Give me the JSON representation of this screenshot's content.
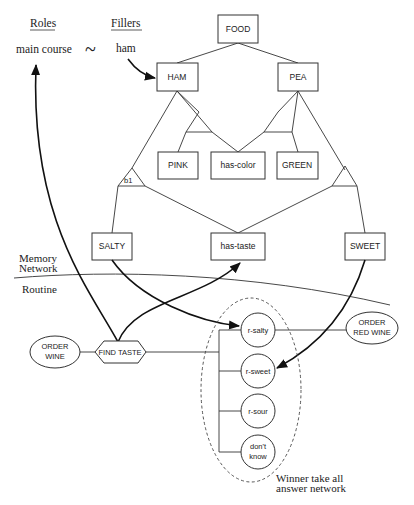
{
  "header": {
    "roles_label": "Roles",
    "fillers_label": "Fillers",
    "role_value": "main course",
    "binding_symbol": "~",
    "filler_value": "ham"
  },
  "memory_network": {
    "region_label_line1": "Memory",
    "region_label_line2": "Network",
    "nodes": {
      "food": "FOOD",
      "ham": "HAM",
      "pea": "PEA",
      "pink": "PINK",
      "has_color": "has-color",
      "green": "GREEN",
      "salty": "SALTY",
      "has_taste": "has-taste",
      "sweet": "SWEET"
    },
    "binding_label": "b1"
  },
  "routine": {
    "region_label": "Routine",
    "order_wine_line1": "ORDER",
    "order_wine_line2": "WINE",
    "find_taste": "FIND TASTE",
    "order_red_wine_line1": "ORDER",
    "order_red_wine_line2": "RED WINE"
  },
  "answer_network": {
    "nodes": {
      "r_salty": "r-salty",
      "r_sweet": "r-sweet",
      "r_sour": "r-sour",
      "dont_know_line1": "don't",
      "dont_know_line2": "know"
    },
    "caption_line1": "Winner take all",
    "caption_line2": "answer network"
  }
}
